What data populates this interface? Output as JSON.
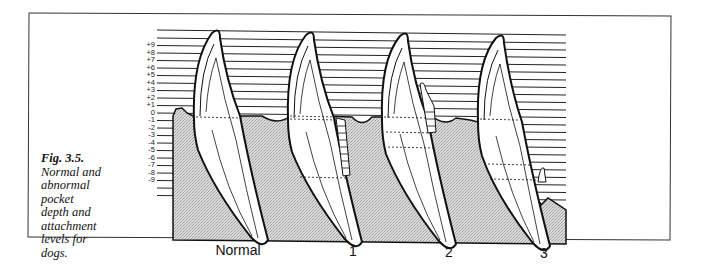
{
  "figure": {
    "number": "Fig. 3.5.",
    "caption": "Normal and abnormal pocket depth and attachment levels for dogs."
  },
  "scale": {
    "labels": [
      "+9",
      "+8",
      "+7",
      "+6",
      "+5",
      "+4",
      "+3",
      "+2",
      "+1",
      "0",
      "-1",
      "-2",
      "-3",
      "-4",
      "-5",
      "-6",
      "-7",
      "-8",
      "-9"
    ]
  },
  "stages": [
    {
      "label": "Normal"
    },
    {
      "label": "1"
    },
    {
      "label": "2"
    },
    {
      "label": "3"
    }
  ],
  "colors": {
    "bone": "#d6d6d6",
    "outline": "#111111",
    "line": "#222222",
    "background": "#ffffff"
  }
}
